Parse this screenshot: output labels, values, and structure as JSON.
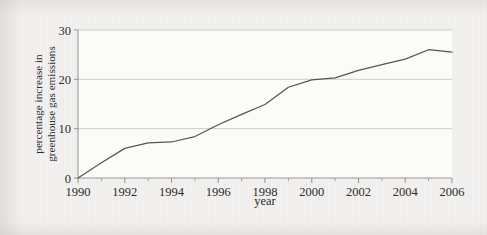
{
  "figure": {
    "background_color": "#f2f1ef",
    "plot_background_color": "#fbfbfa",
    "axis_color": "#9a9a98",
    "grid_color": "#c8c8c6",
    "line_color": "#555553",
    "text_color": "#2b2b2b"
  },
  "chart_data": {
    "type": "line",
    "title": "",
    "subtitle": "",
    "xlabel": "year",
    "ylabel": "percentage increase in greenhouse gas emissions",
    "ylabel_line1": "percentage increase in",
    "ylabel_line2": "greenhouse gas emissions",
    "xlim": [
      1990,
      2006
    ],
    "ylim": [
      0,
      30
    ],
    "x_major_ticks": [
      1990,
      1992,
      1994,
      1996,
      1998,
      2000,
      2002,
      2004,
      2006
    ],
    "x_major_tick_labels": [
      "1990",
      "1992",
      "1994",
      "1996",
      "1998",
      "2000",
      "2002",
      "2004",
      "2006"
    ],
    "x_minor_ticks": [
      1991,
      1993,
      1995,
      1997,
      1999,
      2001,
      2003,
      2005
    ],
    "y_ticks": [
      0,
      10,
      20,
      30
    ],
    "y_tick_labels": [
      "0",
      "10",
      "20",
      "30"
    ],
    "grid": "horizontal",
    "legend": "none",
    "annotations": [],
    "series": [
      {
        "name": "percentage increase in greenhouse gas emissions",
        "color": "#555553",
        "x": [
          1990,
          1991,
          1992,
          1993,
          1994,
          1995,
          1996,
          1997,
          1998,
          1999,
          2000,
          2001,
          2002,
          2003,
          2004,
          2005,
          2006
        ],
        "values": [
          0.0,
          3.1,
          6.0,
          7.1,
          7.3,
          8.4,
          10.8,
          12.9,
          14.9,
          18.4,
          19.9,
          20.3,
          21.8,
          23.0,
          24.1,
          26.0,
          25.5
        ]
      }
    ]
  }
}
